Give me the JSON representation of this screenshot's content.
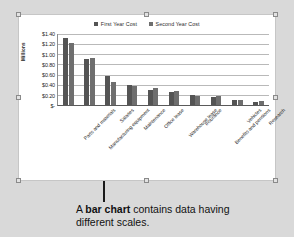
{
  "chart_data": {
    "type": "bar",
    "title": "",
    "subtitle": "",
    "xlabel": "",
    "ylabel": "Millions",
    "ylim": [
      0,
      1.4
    ],
    "grid": true,
    "legend_position": "top-center",
    "ytick_labels": [
      "$1.40",
      "$1.20",
      "$1.00",
      "$0.80",
      "$0.60",
      "$0.40",
      "$0.20",
      "$-"
    ],
    "ytick_values": [
      1.4,
      1.2,
      1.0,
      0.8,
      0.6,
      0.4,
      0.2,
      0.0
    ],
    "categories": [
      "Parts and materials",
      "Manufacturing equipment",
      "Salaries",
      "Maintenance",
      "Office lease",
      "Warehouse lease",
      "Insurance",
      "Benefits and pensions",
      "Vehicles",
      "Research"
    ],
    "series": [
      {
        "name": "First Year Cost",
        "color": "#545454",
        "values": [
          1.33,
          0.9,
          0.57,
          0.4,
          0.3,
          0.26,
          0.19,
          0.15,
          0.09,
          0.05
        ]
      },
      {
        "name": "Second Year Cost",
        "color": "#6e6e6e",
        "values": [
          1.22,
          0.93,
          0.45,
          0.38,
          0.33,
          0.27,
          0.18,
          0.18,
          0.09,
          0.07
        ]
      }
    ]
  },
  "chart_object": {
    "selected": true,
    "handle_count": 8
  },
  "caption": {
    "lead": "A ",
    "bold": "bar chart",
    "rest": " contains data having different scales."
  }
}
